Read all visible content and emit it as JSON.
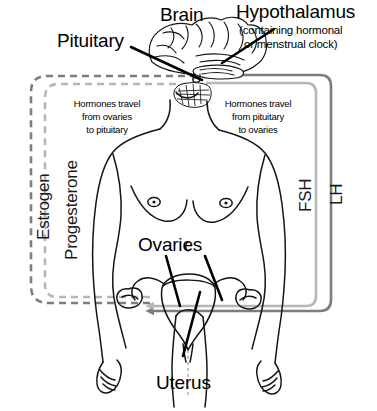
{
  "diagram": {
    "type": "flow-diagram",
    "background": "#ffffff"
  },
  "labels": {
    "brain": "Brain",
    "pituitary": "Pituitary",
    "hypothalamus": "Hypothalamus",
    "hypothalamus_sub_line1": "(containing hormonal",
    "hypothalamus_sub_line2": "or menstrual clock)",
    "ovaries": "Ovaries",
    "uterus": "Uterus"
  },
  "notes": {
    "left_note_line1": "Hormones travel",
    "left_note_line2": "from ovaries",
    "left_note_line3": "to pituitary",
    "right_note_line1": "Hormones travel",
    "right_note_line2": "from pituitary",
    "right_note_line3": "to ovaries"
  },
  "pathways": {
    "estrogen": {
      "label": "Estrogen",
      "color": "#7d7d7d",
      "style": "dashed",
      "direction": "ovaries-to-pituitary"
    },
    "progesterone": {
      "label": "Progesterone",
      "color": "#b6b6b6",
      "style": "dashed",
      "direction": "ovaries-to-pituitary"
    },
    "fsh": {
      "label": "FSH",
      "color": "#b6b6b6",
      "style": "solid",
      "direction": "pituitary-to-ovaries"
    },
    "lh": {
      "label": "LH",
      "color": "#7d7d7d",
      "style": "solid",
      "direction": "pituitary-to-ovaries"
    }
  },
  "colors": {
    "outline": "#111111",
    "dark_gray": "#7d7d7d",
    "light_gray": "#b6b6b6",
    "text": "#000000"
  }
}
